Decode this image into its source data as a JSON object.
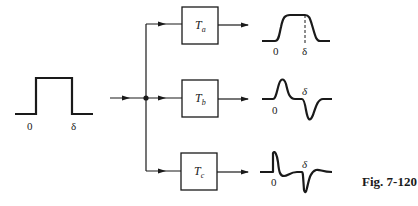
{
  "figure": {
    "caption": "Fig. 7-120",
    "line_color": "#1a1a1a",
    "background": "#ffffff"
  },
  "input_pulse": {
    "label_start": "0",
    "label_end": "δ"
  },
  "blocks": [
    {
      "name": "T",
      "subscript": "a"
    },
    {
      "name": "T",
      "subscript": "b"
    },
    {
      "name": "T",
      "subscript": "c"
    }
  ],
  "outputs": [
    {
      "label_start": "0",
      "label_end": "δ",
      "shape": "smoothed rectangular pulse"
    },
    {
      "label_start": "0",
      "label_end": "δ",
      "shape": "positive spike then negative spike"
    },
    {
      "label_start": "0",
      "label_end": "δ",
      "shape": "sharp positive spike with undershoot, then sharp negative spike"
    }
  ]
}
